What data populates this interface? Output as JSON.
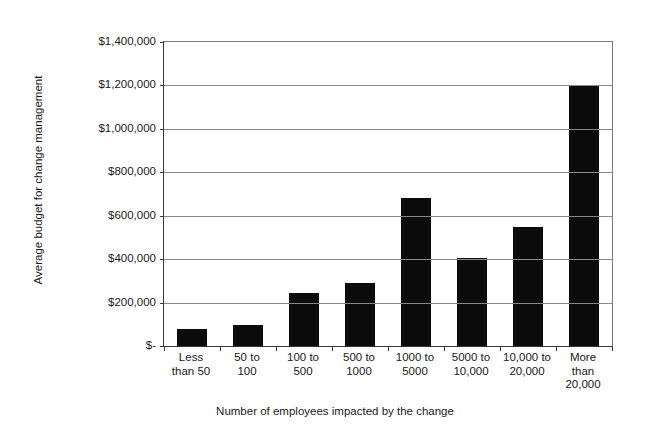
{
  "chart_data": {
    "type": "bar",
    "title": "",
    "xlabel": "Number of employees impacted by the change",
    "ylabel": "Average budget for change management",
    "categories": [
      "Less than 50",
      "50 to 100",
      "100 to 500",
      "500 to 1000",
      "1000 to 5000",
      "5000 to 10,000",
      "10,000 to 20,000",
      "More than 20,000"
    ],
    "category_lines": [
      [
        "Less",
        "than 50"
      ],
      [
        "50 to",
        "100"
      ],
      [
        "100 to",
        "500"
      ],
      [
        "500 to",
        "1000"
      ],
      [
        "1000 to",
        "5000"
      ],
      [
        "5000 to",
        "10,000"
      ],
      [
        "10,000 to",
        "20,000"
      ],
      [
        "More",
        "than",
        "20,000"
      ]
    ],
    "values": [
      80000,
      95000,
      245000,
      290000,
      680000,
      405000,
      550000,
      1200000
    ],
    "ylim": [
      0,
      1400000
    ],
    "ytick_values": [
      1400000,
      1200000,
      1000000,
      800000,
      600000,
      400000,
      200000,
      0
    ],
    "ytick_labels": [
      "$1,400,000",
      "$1,200,000",
      "$1,000,000",
      "$800,000",
      "$600,000",
      "$400,000",
      "$200,000",
      "$-"
    ],
    "grid": true,
    "legend": "none",
    "series_color": "#0b0b0b",
    "gridline_color": "#8a8a8a",
    "axis_color": "#3a3a3a",
    "background_color": "#ffffff"
  }
}
